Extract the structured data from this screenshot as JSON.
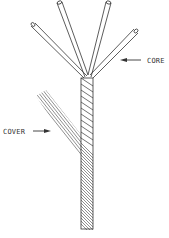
{
  "diagram": {
    "type": "cable-construction",
    "labels": {
      "core": "CORE",
      "cover": "COVER"
    },
    "colors": {
      "stroke": "#333333",
      "background": "#ffffff"
    },
    "components": [
      {
        "id": "core",
        "description": "Twisted multi-strand core with four wires fanning out at the top"
      },
      {
        "id": "cover",
        "description": "Braided/served cover strands joining the core from the left"
      }
    ]
  }
}
